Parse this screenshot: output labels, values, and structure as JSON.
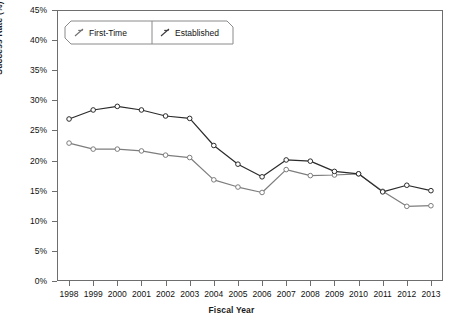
{
  "chart_data": {
    "type": "line",
    "title": "",
    "xlabel": "Fiscal Year",
    "ylabel": "Success Rate (%)",
    "categories": [
      "1998",
      "1999",
      "2000",
      "2001",
      "2002",
      "2003",
      "2004",
      "2005",
      "2006",
      "2007",
      "2008",
      "2009",
      "2010",
      "2011",
      "2012",
      "2013"
    ],
    "x": [
      1998,
      1999,
      2000,
      2001,
      2002,
      2003,
      2004,
      2005,
      2006,
      2007,
      2008,
      2009,
      2010,
      2011,
      2012,
      2013
    ],
    "ylim": [
      0,
      45
    ],
    "ytick_values": [
      0,
      5,
      10,
      15,
      20,
      25,
      30,
      35,
      40,
      45
    ],
    "ytick_labels": [
      "0%",
      "5%",
      "10%",
      "15%",
      "20%",
      "25%",
      "30%",
      "35%",
      "40%",
      "45%"
    ],
    "grid": false,
    "legend_position": "top-left",
    "marker": "open-circle",
    "series": [
      {
        "name": "First-Time",
        "color": "#7d7d7d",
        "values": [
          22.9,
          21.9,
          21.9,
          21.6,
          20.9,
          20.5,
          16.8,
          15.6,
          14.7,
          18.5,
          17.5,
          17.6,
          17.8,
          14.9,
          12.4,
          12.5
        ]
      },
      {
        "name": "Established",
        "color": "#2b2b2b",
        "values": [
          26.9,
          28.4,
          29.0,
          28.4,
          27.4,
          27.0,
          22.5,
          19.4,
          17.3,
          20.1,
          19.9,
          18.2,
          17.8,
          14.8,
          15.9,
          15.0
        ]
      }
    ]
  },
  "legend": {
    "items": [
      {
        "label": "First-Time"
      },
      {
        "label": "Established"
      }
    ]
  },
  "axes": {
    "y_title": "Success Rate (%)",
    "x_title": "Fiscal Year"
  }
}
